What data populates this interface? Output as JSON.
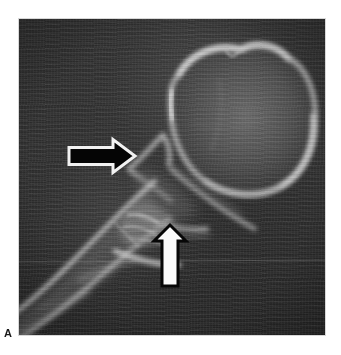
{
  "figure": {
    "panel_letter": "A",
    "modality": "ct-radiograph",
    "caption_visible": false,
    "background_color": "#ffffff",
    "image_frame": {
      "x": 19,
      "y": 19,
      "width": 306,
      "height": 316,
      "field_color": "#2c2c2c"
    }
  },
  "annotations": [
    {
      "id": "black-arrow",
      "name": "black-arrow-annotation",
      "style": "solid-black-with-white-outline",
      "fill_color": "#050505",
      "outline_color": "#f2f2f2",
      "direction": "right",
      "tail_x": 50,
      "tip_x": 116,
      "center_y": 137,
      "shaft_height": 17,
      "head_height": 33
    },
    {
      "id": "white-arrow",
      "name": "white-arrow-annotation",
      "style": "solid-white-with-black-outline",
      "fill_color": "#fbfbfb",
      "outline_color": "#070707",
      "direction": "up",
      "center_x": 151,
      "tip_y": 206,
      "tail_y": 267,
      "shaft_width": 16,
      "head_width": 33
    }
  ],
  "structures": [
    {
      "id": "round-bone",
      "name": "rounded-tarsal-bone",
      "description": "large rounded bone with bright cortical rim, upper right",
      "cortex_brightness": "#d8d8d8",
      "marrow_brightness": "#5a5a5a"
    },
    {
      "id": "oblique-shaft",
      "name": "oblique-bone-shaft",
      "description": "elongated bright cortical shaft running to lower left",
      "cortex_brightness": "#e0e0e0"
    },
    {
      "id": "joint-region",
      "name": "joint-articulation-region",
      "description": "cortical lines converging at articulation indicated by arrows",
      "cortex_brightness": "#cccccc"
    }
  ]
}
